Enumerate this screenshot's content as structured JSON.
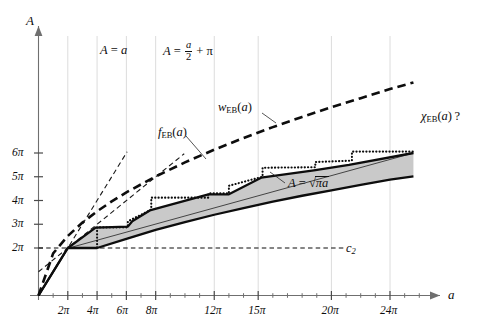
{
  "chart_data": {
    "type": "line",
    "title": "",
    "xlabel": "a",
    "ylabel": "A",
    "xlim": [
      0,
      27
    ],
    "ylim": [
      0,
      6.6
    ],
    "xunit": "pi",
    "yunit": "pi",
    "grid": "light vertical gridlines at major x ticks",
    "legend": "inline curve labels",
    "axes": {
      "x_name": "a",
      "y_name": "A",
      "x_major_ticks": [
        {
          "value": 2,
          "label": "2π"
        },
        {
          "value": 4,
          "label": "4π"
        },
        {
          "value": 6,
          "label": "6π"
        },
        {
          "value": 8,
          "label": "8π"
        },
        {
          "value": 12,
          "label": "12π"
        },
        {
          "value": 15,
          "label": "15π"
        },
        {
          "value": 20,
          "label": "20π"
        },
        {
          "value": 24,
          "label": "24π"
        }
      ],
      "x_minor_ticks": [
        1,
        3,
        5,
        7,
        9,
        10,
        11,
        13,
        14,
        16,
        17,
        18,
        19,
        21,
        22,
        23,
        25,
        26
      ],
      "y_major_ticks": [
        {
          "value": 2,
          "label": "2π"
        },
        {
          "value": 3,
          "label": "3π"
        },
        {
          "value": 4,
          "label": "4π"
        },
        {
          "value": 5,
          "label": "5π"
        },
        {
          "value": 6,
          "label": "6π"
        }
      ]
    },
    "annotations": [
      {
        "name": "A = a",
        "text": "A = a",
        "x": 8.2,
        "y": 5.9
      },
      {
        "name": "A = a/2 + pi",
        "text": "A = a/2 + π",
        "x": 12.6,
        "y": 5.9
      },
      {
        "name": "w_EB(a)",
        "text": "w_EB(a)",
        "x": 16.6,
        "y": 5.05
      },
      {
        "name": "f_EB(a)",
        "text": "f_EB(a)",
        "x": 11.8,
        "y": 4.45
      },
      {
        "name": "chi_EB(a) ?",
        "text": "χ_EB(a) ?",
        "x": 24.6,
        "y": 5.15
      },
      {
        "name": "A = sqrt(pi a)",
        "text": "A = √(πa)",
        "x": 17.6,
        "y": 3.65
      },
      {
        "name": "c_2",
        "text": "c₂",
        "x": 21.6,
        "y": 2.0
      }
    ],
    "series": [
      {
        "name": "A = a",
        "style": "dashed-thin",
        "points": [
          [
            0,
            0
          ],
          [
            6.05,
            6.05
          ]
        ]
      },
      {
        "name": "A = a/2 + pi",
        "style": "dashed-thin",
        "points": [
          [
            0,
            1
          ],
          [
            9.95,
            5.97
          ]
        ]
      },
      {
        "name": "A = sqrt(pi a)",
        "style": "dashed-heavy",
        "description": "A equals square root of pi times a",
        "points": [
          [
            0,
            0
          ],
          [
            1,
            1.772
          ],
          [
            2,
            2.506
          ],
          [
            3,
            3.069
          ],
          [
            4,
            3.545
          ],
          [
            5,
            3.963
          ],
          [
            6,
            4.342
          ],
          [
            8,
            5.013
          ],
          [
            10,
            5.605
          ],
          [
            12,
            6.14
          ],
          [
            14,
            6.63
          ],
          [
            16,
            7.09
          ],
          [
            18,
            7.52
          ],
          [
            20,
            7.93
          ],
          [
            22,
            8.31
          ],
          [
            24,
            8.69
          ],
          [
            25.6,
            8.97
          ]
        ]
      },
      {
        "name": "lower bound curve",
        "style": "solid-heavy",
        "description": "lower boundary of shaded region; rises from origin through (2,2pi) then sqrt-like",
        "points": [
          [
            0,
            0
          ],
          [
            2,
            2.0
          ],
          [
            4,
            2.0
          ],
          [
            6,
            2.38
          ],
          [
            8,
            2.76
          ],
          [
            10,
            3.09
          ],
          [
            12,
            3.4
          ],
          [
            14,
            3.68
          ],
          [
            16,
            3.95
          ],
          [
            18,
            4.2
          ],
          [
            20,
            4.43
          ],
          [
            22,
            4.66
          ],
          [
            24,
            4.88
          ],
          [
            25.6,
            5.02
          ]
        ]
      },
      {
        "name": "f_EB(a) upper staircase",
        "style": "solid-heavy",
        "description": "upper boundary of shaded region; piecewise linear with plateaus",
        "points": [
          [
            0,
            0
          ],
          [
            2,
            2.0
          ],
          [
            3.9,
            2.86
          ],
          [
            6.1,
            2.9
          ],
          [
            6.4,
            3.13
          ],
          [
            7.6,
            3.58
          ],
          [
            11.6,
            4.26
          ],
          [
            13.0,
            4.26
          ],
          [
            15.2,
            4.96
          ],
          [
            18.8,
            5.27
          ],
          [
            21.2,
            5.5
          ],
          [
            25.6,
            6.0
          ]
        ]
      },
      {
        "name": "w_EB(a) dotted step",
        "style": "dotted",
        "description": "dotted step function above f_EB",
        "points": [
          [
            2,
            2.0
          ],
          [
            4,
            2.0
          ],
          [
            4,
            2.87
          ],
          [
            6.1,
            2.87
          ],
          [
            6.1,
            3.12
          ],
          [
            7.7,
            3.62
          ],
          [
            7.7,
            4.12
          ],
          [
            11.6,
            4.12
          ],
          [
            11.6,
            4.3
          ],
          [
            13.0,
            4.3
          ],
          [
            13.0,
            4.62
          ],
          [
            15.3,
            5.0
          ],
          [
            15.3,
            5.38
          ],
          [
            18.9,
            5.4
          ],
          [
            18.9,
            5.62
          ],
          [
            21.4,
            5.68
          ],
          [
            21.4,
            6.06
          ],
          [
            25.6,
            6.06
          ]
        ]
      },
      {
        "name": "c_2 horizontal dashed line",
        "style": "dashed-thin",
        "description": "horizontal dashed line at A = 2pi",
        "points": [
          [
            0,
            2.0
          ],
          [
            21.0,
            2.0
          ]
        ]
      },
      {
        "name": "thin straight chord",
        "style": "solid-thin",
        "description": "thin solid line from origin-ish up to the right along the upper staircase",
        "points": [
          [
            1.9,
            1.97
          ],
          [
            25.6,
            6.0
          ]
        ]
      }
    ],
    "shaded_region": {
      "name": "gray band between lower bound and f_EB",
      "color": "#c9c9c9"
    }
  },
  "colors": {
    "ink": "#0d0d0d",
    "axis": "#6f6f6f",
    "grid": "#dcdcdc",
    "band": "#c9c9c9"
  }
}
